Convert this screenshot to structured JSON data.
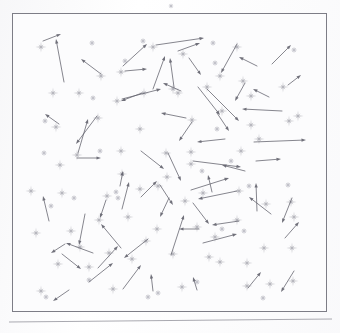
{
  "figure": {
    "type": "vector-field-scatter",
    "width": 340,
    "height": 333
  },
  "colors": {
    "background": "#ffffff",
    "paper": "#fcfcfd",
    "frame_stroke": "#7d7d86",
    "star_fill": "#b3b3bb",
    "small_star_fill": "#c2c2ca",
    "arrow_stroke": "#61616b",
    "baseline_stroke": "#9a9aa2"
  },
  "frame": {
    "x": 12,
    "y": 13,
    "width": 315,
    "height": 299,
    "stroke_width": 1
  },
  "baseline": {
    "x1": 9,
    "y1": 322,
    "x2": 332,
    "y2": 319,
    "stroke_width": 1
  },
  "outside_star": {
    "cx": 171,
    "cy": 6,
    "r": 2.2
  },
  "chart_data": {
    "type": "scatter",
    "title": "",
    "subtitle": "",
    "xlabel": "",
    "ylabel": "",
    "grid": false,
    "legend": null,
    "xlim": [
      12,
      327
    ],
    "ylim": [
      13,
      312
    ],
    "marker": "8-point-star",
    "arrow_head_length": 4.5,
    "arrow_head_width": 3.2,
    "stars_large": [
      [
        40,
        46
      ],
      [
        52,
        92
      ],
      [
        78,
        92
      ],
      [
        100,
        75
      ],
      [
        120,
        71
      ],
      [
        152,
        46
      ],
      [
        182,
        53
      ],
      [
        236,
        46
      ],
      [
        219,
        75
      ],
      [
        177,
        92
      ],
      [
        143,
        92
      ],
      [
        116,
        100
      ],
      [
        55,
        126
      ],
      [
        97,
        117
      ],
      [
        139,
        128
      ],
      [
        172,
        88
      ],
      [
        206,
        86
      ],
      [
        250,
        95
      ],
      [
        242,
        80
      ],
      [
        282,
        86
      ],
      [
        191,
        119
      ],
      [
        221,
        110
      ],
      [
        250,
        124
      ],
      [
        288,
        120
      ],
      [
        59,
        164
      ],
      [
        76,
        154
      ],
      [
        120,
        150
      ],
      [
        165,
        152
      ],
      [
        190,
        151
      ],
      [
        121,
        173
      ],
      [
        166,
        176
      ],
      [
        190,
        163
      ],
      [
        258,
        138
      ],
      [
        297,
        115
      ],
      [
        240,
        150
      ],
      [
        202,
        192
      ],
      [
        139,
        188
      ],
      [
        157,
        185
      ],
      [
        98,
        219
      ],
      [
        70,
        230
      ],
      [
        79,
        246
      ],
      [
        127,
        216
      ],
      [
        156,
        228
      ],
      [
        131,
        258
      ],
      [
        184,
        200
      ],
      [
        196,
        226
      ],
      [
        238,
        190
      ],
      [
        236,
        219
      ],
      [
        265,
        203
      ],
      [
        290,
        201
      ],
      [
        293,
        216
      ],
      [
        263,
        247
      ],
      [
        291,
        247
      ],
      [
        57,
        263
      ],
      [
        88,
        266
      ],
      [
        108,
        252
      ],
      [
        145,
        240
      ],
      [
        172,
        253
      ],
      [
        214,
        236
      ],
      [
        219,
        261
      ],
      [
        181,
        286
      ],
      [
        112,
        288
      ],
      [
        246,
        285
      ],
      [
        269,
        283
      ],
      [
        292,
        280
      ],
      [
        35,
        232
      ],
      [
        61,
        192
      ],
      [
        30,
        190
      ],
      [
        208,
        256
      ],
      [
        246,
        262
      ],
      [
        40,
        290
      ],
      [
        106,
        195
      ]
    ],
    "stars_small": [
      [
        91,
        42
      ],
      [
        124,
        60
      ],
      [
        212,
        42
      ],
      [
        214,
        62
      ],
      [
        293,
        49
      ],
      [
        142,
        40
      ],
      [
        44,
        120
      ],
      [
        43,
        152
      ],
      [
        92,
        97
      ],
      [
        99,
        150
      ],
      [
        216,
        128
      ],
      [
        248,
        185
      ],
      [
        287,
        184
      ],
      [
        243,
        230
      ],
      [
        230,
        160
      ],
      [
        73,
        197
      ],
      [
        115,
        191
      ],
      [
        117,
        197
      ],
      [
        50,
        205
      ],
      [
        88,
        279
      ],
      [
        221,
        228
      ],
      [
        157,
        292
      ],
      [
        196,
        281
      ],
      [
        147,
        296
      ],
      [
        45,
        296
      ],
      [
        262,
        297
      ],
      [
        201,
        170
      ]
    ],
    "arrows": [
      [
        42,
        40,
        60,
        33
      ],
      [
        63,
        81,
        55,
        38
      ],
      [
        100,
        73,
        80,
        58
      ],
      [
        122,
        65,
        146,
        43
      ],
      [
        155,
        44,
        203,
        37
      ],
      [
        177,
        50,
        199,
        42
      ],
      [
        124,
        70,
        146,
        68
      ],
      [
        173,
        86,
        169,
        57
      ],
      [
        188,
        57,
        200,
        74
      ],
      [
        236,
        43,
        220,
        72
      ],
      [
        271,
        63,
        290,
        44
      ],
      [
        256,
        65,
        238,
        56
      ],
      [
        152,
        88,
        164,
        55
      ],
      [
        180,
        90,
        162,
        82
      ],
      [
        121,
        98,
        160,
        88
      ],
      [
        141,
        92,
        120,
        100
      ],
      [
        58,
        123,
        44,
        113
      ],
      [
        197,
        86,
        219,
        114
      ],
      [
        244,
        82,
        234,
        100
      ],
      [
        268,
        96,
        252,
        88
      ],
      [
        287,
        84,
        300,
        74
      ],
      [
        77,
        152,
        87,
        118
      ],
      [
        96,
        115,
        75,
        143
      ],
      [
        185,
        117,
        160,
        112
      ],
      [
        191,
        121,
        178,
        140
      ],
      [
        206,
        88,
        238,
        120
      ],
      [
        216,
        112,
        228,
        130
      ],
      [
        224,
        138,
        196,
        141
      ],
      [
        281,
        110,
        241,
        108
      ],
      [
        255,
        160,
        280,
        158
      ],
      [
        76,
        157,
        100,
        157
      ],
      [
        140,
        150,
        163,
        168
      ],
      [
        253,
        141,
        305,
        139
      ],
      [
        192,
        160,
        240,
        166
      ],
      [
        244,
        170,
        221,
        164
      ],
      [
        167,
        152,
        180,
        180
      ],
      [
        190,
        189,
        228,
        177
      ],
      [
        211,
        191,
        207,
        174
      ],
      [
        119,
        185,
        122,
        170
      ],
      [
        121,
        208,
        128,
        181
      ],
      [
        140,
        196,
        156,
        180
      ],
      [
        159,
        184,
        172,
        204
      ],
      [
        48,
        220,
        42,
        195
      ],
      [
        84,
        213,
        78,
        244
      ],
      [
        168,
        197,
        159,
        216
      ],
      [
        192,
        202,
        208,
        223
      ],
      [
        236,
        190,
        197,
        198
      ],
      [
        256,
        210,
        255,
        182
      ],
      [
        291,
        197,
        281,
        222
      ],
      [
        120,
        247,
        100,
        223
      ],
      [
        147,
        238,
        123,
        257
      ],
      [
        64,
        243,
        50,
        252
      ],
      [
        92,
        252,
        65,
        242
      ],
      [
        97,
        267,
        117,
        245
      ],
      [
        122,
        288,
        140,
        264
      ],
      [
        170,
        254,
        183,
        214
      ],
      [
        202,
        242,
        236,
        233
      ],
      [
        198,
        228,
        178,
        228
      ],
      [
        238,
        220,
        211,
        224
      ],
      [
        270,
        213,
        248,
        196
      ],
      [
        284,
        237,
        298,
        221
      ],
      [
        68,
        289,
        52,
        300
      ],
      [
        152,
        290,
        150,
        273
      ],
      [
        196,
        289,
        192,
        276
      ],
      [
        247,
        287,
        260,
        271
      ],
      [
        293,
        270,
        280,
        291
      ],
      [
        61,
        253,
        80,
        268
      ],
      [
        88,
        281,
        112,
        262
      ],
      [
        105,
        199,
        99,
        217
      ]
    ]
  }
}
